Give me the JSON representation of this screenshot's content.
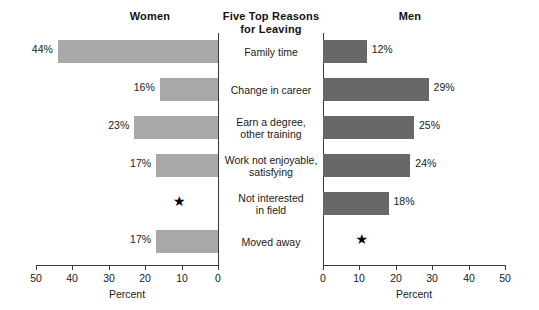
{
  "headings": {
    "left": "Women",
    "center_line1": "Five Top Reasons",
    "center_line2": "for Leaving",
    "right": "Men"
  },
  "axes": {
    "left_title": "Percent",
    "right_title": "Percent",
    "left_ticks": [
      "50",
      "40",
      "30",
      "20",
      "10",
      "0"
    ],
    "right_ticks": [
      "0",
      "10",
      "20",
      "30",
      "40",
      "50"
    ],
    "max": 50,
    "suppressed_marker": "★"
  },
  "colors": {
    "women_bar": "#a8a8a8",
    "men_bar": "#686868",
    "axis": "#3a3a3a",
    "text": "#1a1a1a",
    "background": "#ffffff"
  },
  "chart_data": {
    "type": "bar",
    "title": "Five Top Reasons for Leaving",
    "subtitle": "",
    "orientation": "horizontal-diverging",
    "xlabel": "Percent",
    "ylabel": "",
    "xlim": [
      0,
      50
    ],
    "grid": false,
    "legend": "column-headings",
    "categories": [
      "Family time",
      "Change in career",
      "Earn a degree, other training",
      "Work not enjoyable, satisfying",
      "Not interested in field",
      "Moved away"
    ],
    "category_lines": [
      [
        "Family time"
      ],
      [
        "Change in career"
      ],
      [
        "Earn a degree,",
        "other training"
      ],
      [
        "Work not enjoyable,",
        "satisfying"
      ],
      [
        "Not interested",
        "in field"
      ],
      [
        "Moved away"
      ]
    ],
    "series": [
      {
        "name": "Women",
        "direction": "left",
        "values": [
          44,
          16,
          23,
          17,
          null,
          17
        ],
        "labels": [
          "44%",
          "16%",
          "23%",
          "17%",
          "★",
          "17%"
        ]
      },
      {
        "name": "Men",
        "direction": "right",
        "values": [
          12,
          29,
          25,
          24,
          18,
          null
        ],
        "labels": [
          "12%",
          "29%",
          "25%",
          "24%",
          "18%",
          "★"
        ]
      }
    ],
    "annotations": [
      {
        "series": "Women",
        "category": "Not interested in field",
        "marker": "★",
        "at_value": 10
      },
      {
        "series": "Men",
        "category": "Moved away",
        "marker": "★",
        "at_value": 10
      }
    ]
  }
}
